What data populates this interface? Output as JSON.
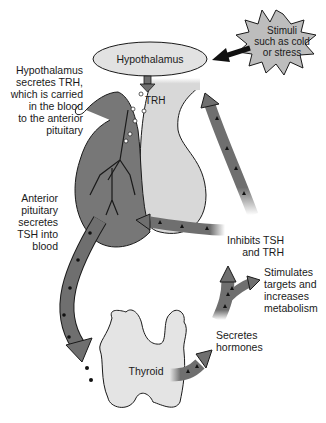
{
  "colors": {
    "gland_dark": "#777777",
    "gland_light": "#d8d8d8",
    "arrow_fill": "#6f6f6f",
    "outline": "#1a1a1a",
    "burst_fill": "#bdbdbd",
    "hypothalamus_fill": "#e2e2e2",
    "thyroid_fill": "#e4e4e4"
  },
  "nodes": {
    "hypothalamus": "Hypothalamus",
    "stimuli": [
      "Stimuli",
      "such as cold",
      "or stress"
    ],
    "trh": "TRH",
    "thyroid": "Thyroid"
  },
  "annotations": {
    "hypothalamus_secretes": [
      "Hypothalamus",
      "secretes TRH,",
      "which is carried",
      "in the blood",
      "to the anterior",
      "pituitary"
    ],
    "anterior_pituitary": [
      "Anterior",
      "pituitary",
      "secretes",
      "TSH into",
      "blood"
    ],
    "inhibits": [
      "Inhibits TSH",
      "and TRH"
    ],
    "stimulates": [
      "Stimulates",
      "targets and",
      "increases",
      "metabolism"
    ],
    "secretes_hormones": [
      "Secretes",
      "hormones"
    ]
  },
  "edges": [
    {
      "from": "stimuli",
      "to": "hypothalamus"
    },
    {
      "from": "hypothalamus",
      "to": "pituitary",
      "label": "TRH"
    },
    {
      "from": "anterior pituitary",
      "to": "thyroid",
      "label": "TSH"
    },
    {
      "from": "thyroid",
      "to": "targets",
      "label": "hormones"
    },
    {
      "from": "hormones",
      "to": "anterior pituitary",
      "label": "inhibits"
    },
    {
      "from": "hormones",
      "to": "hypothalamus",
      "label": "inhibits"
    }
  ]
}
